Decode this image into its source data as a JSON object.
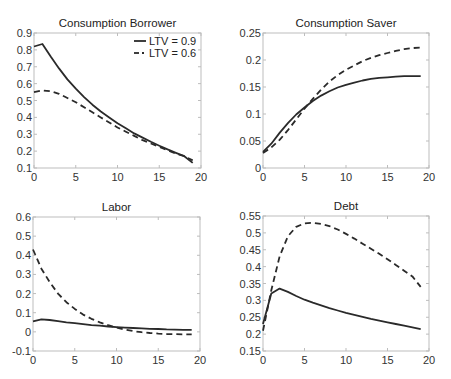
{
  "chart_data": [
    {
      "type": "line",
      "title": "Consumption Borrower",
      "xlabel": "",
      "ylabel": "",
      "xlim": [
        0,
        20
      ],
      "ylim": [
        0.1,
        0.9
      ],
      "xticks": [
        "0",
        "5",
        "10",
        "15",
        "20"
      ],
      "yticks": [
        "0.1",
        "0.2",
        "0.3",
        "0.4",
        "0.5",
        "0.6",
        "0.7",
        "0.8",
        "0.9"
      ],
      "grid": false,
      "legend_position": "upper right",
      "x": [
        0,
        1,
        2,
        3,
        4,
        5,
        6,
        7,
        8,
        9,
        10,
        11,
        12,
        13,
        14,
        15,
        16,
        17,
        18,
        19
      ],
      "series": [
        {
          "name": "LTV = 0.9",
          "style": "solid",
          "values": [
            0.82,
            0.835,
            0.76,
            0.69,
            0.625,
            0.57,
            0.52,
            0.475,
            0.435,
            0.4,
            0.365,
            0.335,
            0.305,
            0.28,
            0.255,
            0.232,
            0.21,
            0.19,
            0.17,
            0.13
          ]
        },
        {
          "name": "LTV = 0.6",
          "style": "dashed",
          "values": [
            0.55,
            0.56,
            0.555,
            0.54,
            0.515,
            0.49,
            0.46,
            0.43,
            0.4,
            0.37,
            0.34,
            0.315,
            0.29,
            0.265,
            0.245,
            0.225,
            0.205,
            0.185,
            0.17,
            0.145
          ]
        }
      ]
    },
    {
      "type": "line",
      "title": "Consumption Saver",
      "xlabel": "",
      "ylabel": "",
      "xlim": [
        0,
        20
      ],
      "ylim": [
        0,
        0.25
      ],
      "xticks": [
        "0",
        "5",
        "10",
        "15",
        "20"
      ],
      "yticks": [
        "0",
        "0.05",
        "0.1",
        "0.15",
        "0.2",
        "0.25"
      ],
      "grid": false,
      "x": [
        0,
        1,
        2,
        3,
        4,
        5,
        6,
        7,
        8,
        9,
        10,
        11,
        12,
        13,
        14,
        15,
        16,
        17,
        18,
        19
      ],
      "series": [
        {
          "name": "LTV = 0.9",
          "style": "solid",
          "values": [
            0.03,
            0.045,
            0.065,
            0.083,
            0.099,
            0.112,
            0.124,
            0.134,
            0.142,
            0.149,
            0.154,
            0.158,
            0.162,
            0.165,
            0.167,
            0.168,
            0.169,
            0.17,
            0.17,
            0.17
          ]
        },
        {
          "name": "LTV = 0.6",
          "style": "dashed",
          "values": [
            0.028,
            0.038,
            0.052,
            0.07,
            0.09,
            0.11,
            0.128,
            0.145,
            0.16,
            0.172,
            0.182,
            0.19,
            0.198,
            0.204,
            0.209,
            0.213,
            0.217,
            0.22,
            0.222,
            0.223
          ]
        }
      ]
    },
    {
      "type": "line",
      "title": "Labor",
      "xlabel": "",
      "ylabel": "",
      "xlim": [
        0,
        20
      ],
      "ylim": [
        -0.1,
        0.6
      ],
      "xticks": [
        "0",
        "5",
        "10",
        "15",
        "20"
      ],
      "yticks": [
        "-0.1",
        "0",
        "0.1",
        "0.2",
        "0.3",
        "0.4",
        "0.5",
        "0.6"
      ],
      "grid": false,
      "x": [
        0,
        1,
        2,
        3,
        4,
        5,
        6,
        7,
        8,
        9,
        10,
        11,
        12,
        13,
        14,
        15,
        16,
        17,
        18,
        19
      ],
      "series": [
        {
          "name": "LTV = 0.9",
          "style": "solid",
          "values": [
            0.055,
            0.065,
            0.062,
            0.056,
            0.05,
            0.045,
            0.04,
            0.035,
            0.032,
            0.028,
            0.025,
            0.022,
            0.02,
            0.018,
            0.016,
            0.015,
            0.013,
            0.012,
            0.011,
            0.01
          ]
        },
        {
          "name": "LTV = 0.6",
          "style": "dashed",
          "values": [
            0.43,
            0.33,
            0.26,
            0.2,
            0.155,
            0.12,
            0.09,
            0.068,
            0.05,
            0.035,
            0.022,
            0.012,
            0.004,
            -0.002,
            -0.006,
            -0.009,
            -0.011,
            -0.012,
            -0.013,
            -0.013
          ]
        }
      ]
    },
    {
      "type": "line",
      "title": "Debt",
      "xlabel": "",
      "ylabel": "",
      "xlim": [
        0,
        20
      ],
      "ylim": [
        0.15,
        0.55
      ],
      "xticks": [
        "0",
        "5",
        "10",
        "15",
        "20"
      ],
      "yticks": [
        "0.15",
        "0.2",
        "0.25",
        "0.3",
        "0.35",
        "0.4",
        "0.45",
        "0.5",
        "0.55"
      ],
      "grid": false,
      "x": [
        0,
        1,
        2,
        3,
        4,
        5,
        6,
        7,
        8,
        9,
        10,
        11,
        12,
        13,
        14,
        15,
        16,
        17,
        18,
        19
      ],
      "series": [
        {
          "name": "LTV = 0.9",
          "style": "solid",
          "values": [
            0.23,
            0.32,
            0.335,
            0.325,
            0.313,
            0.302,
            0.293,
            0.285,
            0.277,
            0.27,
            0.263,
            0.257,
            0.251,
            0.245,
            0.24,
            0.235,
            0.23,
            0.225,
            0.22,
            0.215
          ]
        },
        {
          "name": "LTV = 0.6",
          "style": "dashed",
          "values": [
            0.21,
            0.33,
            0.43,
            0.49,
            0.518,
            0.528,
            0.53,
            0.527,
            0.52,
            0.51,
            0.497,
            0.483,
            0.468,
            0.453,
            0.438,
            0.422,
            0.405,
            0.388,
            0.371,
            0.34
          ]
        }
      ]
    }
  ],
  "panels": [
    {
      "title": "Consumption Borrower",
      "legend": [
        "LTV = 0.9",
        "LTV = 0.6"
      ]
    },
    {
      "title": "Consumption Saver"
    },
    {
      "title": "Labor"
    },
    {
      "title": "Debt"
    }
  ]
}
